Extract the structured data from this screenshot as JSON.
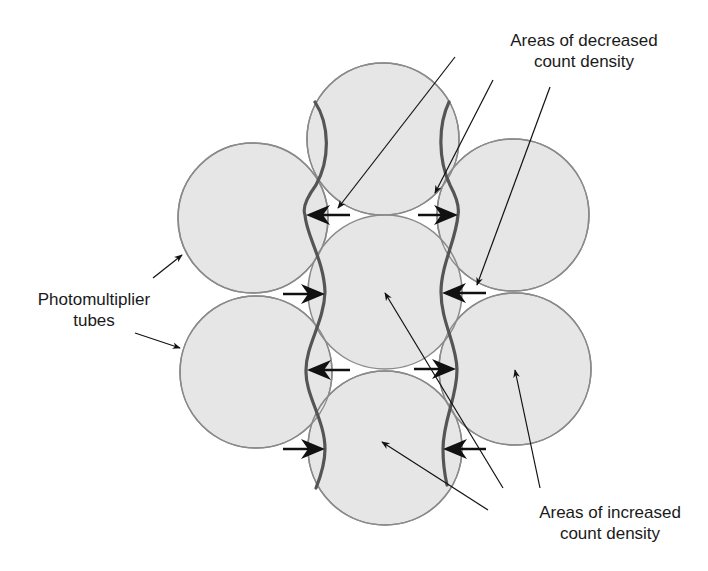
{
  "labels": {
    "decreased": {
      "line1": "Areas of decreased",
      "line2": "count density"
    },
    "increased": {
      "line1": "Areas of increased",
      "line2": "count density"
    },
    "pmt": {
      "line1": "Photomultiplier",
      "line2": "tubes"
    }
  },
  "colors": {
    "tube_fill": "#e6e6e6",
    "tube_stroke": "#8a8a8a",
    "wave_stroke": "#555555",
    "arrow": "#111111",
    "background": "#ffffff"
  },
  "tubes": [
    {
      "name": "top",
      "cx": 383,
      "cy": 139,
      "r": 76
    },
    {
      "name": "top-left",
      "cx": 253,
      "cy": 218,
      "r": 75
    },
    {
      "name": "top-right",
      "cx": 513,
      "cy": 215,
      "r": 76
    },
    {
      "name": "center",
      "cx": 385,
      "cy": 292,
      "r": 77
    },
    {
      "name": "bottom-left",
      "cx": 256,
      "cy": 372,
      "r": 76
    },
    {
      "name": "bottom-right",
      "cx": 515,
      "cy": 369,
      "r": 76
    },
    {
      "name": "bottom",
      "cx": 385,
      "cy": 448,
      "r": 77
    }
  ]
}
